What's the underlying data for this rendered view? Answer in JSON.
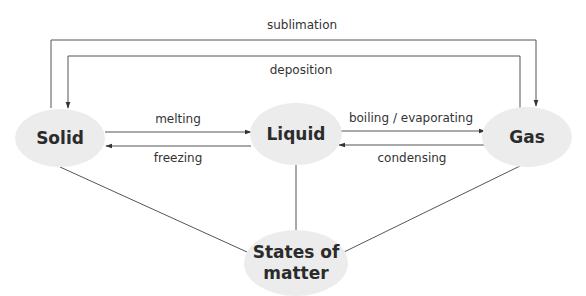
{
  "diagram": {
    "title": "States of matter",
    "nodes": {
      "solid": {
        "label": "Solid"
      },
      "liquid": {
        "label": "Liquid"
      },
      "gas": {
        "label": "Gas"
      },
      "center": {
        "line1": "States of",
        "line2": "matter"
      }
    },
    "edges": {
      "sublimation": {
        "label": "sublimation",
        "from": "Solid",
        "to": "Gas"
      },
      "deposition": {
        "label": "deposition",
        "from": "Gas",
        "to": "Solid"
      },
      "melting": {
        "label": "melting",
        "from": "Solid",
        "to": "Liquid"
      },
      "freezing": {
        "label": "freezing",
        "from": "Liquid",
        "to": "Solid"
      },
      "boiling": {
        "label": "boiling / evaporating",
        "from": "Liquid",
        "to": "Gas"
      },
      "condensing": {
        "label": "condensing",
        "from": "Gas",
        "to": "Liquid"
      }
    },
    "colors": {
      "node_fill": "#ececec",
      "line": "#555555",
      "text": "#2b2b2b"
    }
  }
}
